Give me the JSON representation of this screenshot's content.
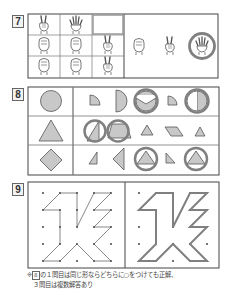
{
  "problems": [
    {
      "number": "7",
      "type": "rock-paper-scissors-matrix",
      "grid": [
        [
          "scissors",
          "paper",
          "blank"
        ],
        [
          "rock",
          "rock",
          "scissors"
        ],
        [
          "rock",
          "rock",
          "scissors"
        ]
      ],
      "choices": [
        "rock",
        "scissors",
        "paper"
      ],
      "answer": "paper"
    },
    {
      "number": "8",
      "type": "shape-composition",
      "rows": [
        {
          "target": "circle",
          "choices": [
            "quarter-circle",
            "half-circle",
            "circle-with-wedge",
            "quarter-circle",
            "half-circle-circle"
          ],
          "circled": [
            2,
            4
          ]
        },
        {
          "target": "triangle",
          "choices": [
            "triangle-split",
            "trapezoid-triangle",
            "small-triangle",
            "parallelogram",
            "small-triangle"
          ],
          "circled": [
            0,
            1
          ]
        },
        {
          "target": "diamond",
          "choices": [
            "small-right-triangle",
            "tall-triangle",
            "triangle-in-circle",
            "small-right-triangle",
            "triangle-in-circle"
          ],
          "circled": [
            2,
            4
          ]
        }
      ]
    },
    {
      "number": "9",
      "type": "dot-grid-copy",
      "grid_size": 5
    }
  ],
  "note": {
    "line1_prefix": "※",
    "box_ref": "8",
    "line1": "の１問目は同じ形ならどちらに○をつけても正解、",
    "line2": "３問目は複数解答あり"
  },
  "colors": {
    "outline": "#444444",
    "fill": "#c8c8c8",
    "answer_circle": "#808080",
    "line": "#555555"
  }
}
